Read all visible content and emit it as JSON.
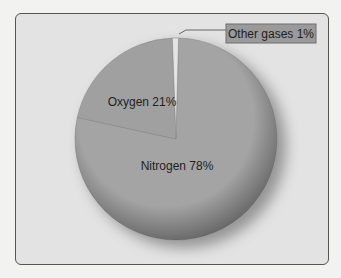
{
  "chart_data": {
    "type": "pie",
    "title": "",
    "slices": [
      {
        "label": "Nitrogen",
        "value": 78,
        "display": "Nitrogen 78%",
        "color": "#a4a4a4"
      },
      {
        "label": "Oxygen",
        "value": 21,
        "display": "Oxygen 21%",
        "color": "#a0a0a0"
      },
      {
        "label": "Other gases",
        "value": 1,
        "display": "Other gases 1%",
        "color": "#e4e4e4"
      }
    ],
    "legend": "none",
    "callout": {
      "slice": "Other gases",
      "text": "Other gases 1%",
      "background": "#9a9a9a"
    }
  }
}
